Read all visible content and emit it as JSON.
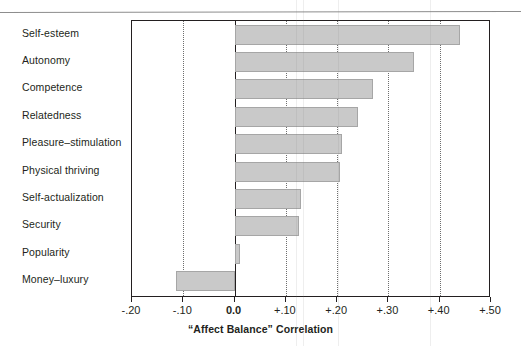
{
  "figure": {
    "axis_title": "“Affect Balance” Correlation"
  },
  "chart_data": {
    "type": "bar",
    "orientation": "horizontal",
    "title": "",
    "subtitle": "",
    "xlabel": "“Affect Balance” Correlation",
    "ylabel": "",
    "categories": [
      "Self-esteem",
      "Autonomy",
      "Competence",
      "Relatedness",
      "Pleasure–stimulation",
      "Physical thriving",
      "Self-actualization",
      "Security",
      "Popularity",
      "Money–luxury"
    ],
    "values": [
      0.44,
      0.35,
      0.27,
      0.24,
      0.21,
      0.205,
      0.13,
      0.125,
      0.01,
      -0.115
    ],
    "xlim": [
      -0.2,
      0.5
    ],
    "xticks": [
      -0.2,
      -0.1,
      0.0,
      0.1,
      0.2,
      0.3,
      0.4,
      0.5
    ],
    "xticklabels": [
      "-.20",
      "-.10",
      "0.0",
      "+.10",
      "+.20",
      "+.30",
      "+.40",
      "+.50"
    ],
    "gridlines": [
      -0.1,
      0.1,
      0.2,
      0.3,
      0.4
    ],
    "grid": true,
    "legend": null,
    "bar_color": "#c9c9c9",
    "bar_border_color": "#a6a6a6",
    "axis_color": "#231f20"
  }
}
